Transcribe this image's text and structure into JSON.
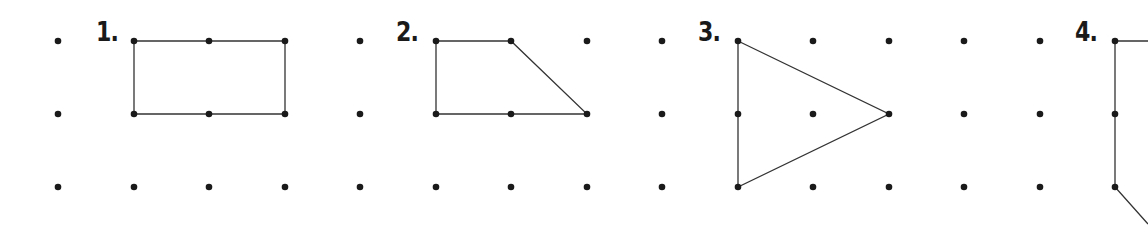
{
  "grid": {
    "columns_x": [
      58,
      134,
      209,
      285,
      360,
      436,
      511,
      587,
      662,
      738,
      813,
      889,
      964,
      1040,
      1115
    ],
    "rows_y": [
      41,
      114,
      187
    ],
    "dot_color": "#1a1a1a",
    "line_color": "#333333"
  },
  "figures": [
    {
      "label": "1.",
      "label_pos": [
        96,
        19
      ],
      "points": [
        [
          134,
          41
        ],
        [
          285,
          41
        ],
        [
          285,
          114
        ],
        [
          134,
          114
        ]
      ],
      "vertices_on_edges": [
        [
          209,
          41
        ],
        [
          209,
          114
        ]
      ]
    },
    {
      "label": "2.",
      "label_pos": [
        396,
        19
      ],
      "points": [
        [
          436,
          41
        ],
        [
          511,
          41
        ],
        [
          587,
          114
        ],
        [
          436,
          114
        ]
      ],
      "vertices_on_edges": [
        [
          511,
          114
        ]
      ]
    },
    {
      "label": "3.",
      "label_pos": [
        698,
        19
      ],
      "points": [
        [
          738,
          41
        ],
        [
          889,
          114
        ],
        [
          738,
          187
        ]
      ],
      "vertices_on_edges": [
        [
          738,
          114
        ]
      ]
    },
    {
      "label": "4.",
      "label_pos": [
        1075,
        19
      ],
      "points": [
        [
          1148,
          41
        ],
        [
          1115,
          41
        ],
        [
          1115,
          187
        ],
        [
          1148,
          224
        ]
      ],
      "open": true,
      "vertices_on_edges": [
        [
          1115,
          114
        ]
      ]
    }
  ]
}
